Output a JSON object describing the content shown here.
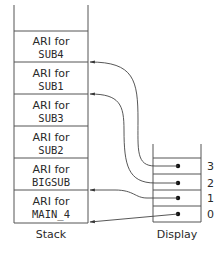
{
  "stack": {
    "label": "Stack",
    "frames": [
      {
        "line1": "ARI for",
        "line2": "SUB4"
      },
      {
        "line1": "ARI for",
        "line2": "SUB1"
      },
      {
        "line1": "ARI for",
        "line2": "SUB3"
      },
      {
        "line1": "ARI for",
        "line2": "SUB2"
      },
      {
        "line1": "ARI for",
        "line2": "BIGSUB"
      },
      {
        "line1": "ARI for",
        "line2": "MAIN_4"
      }
    ]
  },
  "display": {
    "label": "Display",
    "entries": [
      {
        "index": "3",
        "points_to": "SUB4"
      },
      {
        "index": "2",
        "points_to": "SUB1"
      },
      {
        "index": "1",
        "points_to": "BIGSUB"
      },
      {
        "index": "0",
        "points_to": "MAIN_4"
      }
    ]
  },
  "colors": {
    "line": "#555555",
    "text": "#2a2a2a"
  }
}
